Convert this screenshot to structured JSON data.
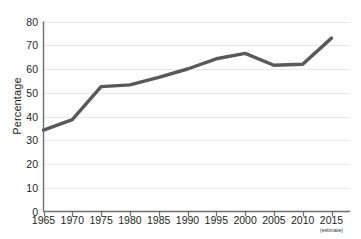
{
  "chart_data": {
    "type": "line",
    "title": "",
    "subtitle": "",
    "xlabel": "",
    "ylabel": "Percentage",
    "x": [
      1965,
      1970,
      1975,
      1980,
      1985,
      1990,
      1995,
      2000,
      2005,
      2010,
      2015
    ],
    "categories": [
      "1965",
      "1970",
      "1975",
      "1980",
      "1985",
      "1990",
      "1995",
      "2000",
      "2005",
      "2010",
      "2015"
    ],
    "values": [
      34.3,
      38.7,
      52.6,
      53.3,
      56.5,
      60.0,
      64.3,
      66.6,
      61.6,
      62.0,
      73.0
    ],
    "series": [
      {
        "name": "Percentage",
        "values": [
          34.3,
          38.7,
          52.6,
          53.3,
          56.5,
          60.0,
          64.3,
          66.6,
          61.6,
          62.0,
          73.0
        ],
        "color": "#595959"
      }
    ],
    "xlim": [
      1965,
      2015
    ],
    "ylim": [
      0,
      80
    ],
    "y_ticks": [
      0,
      10,
      20,
      30,
      40,
      50,
      60,
      70,
      80
    ],
    "y_tick_labels": [
      "0",
      "10",
      "20",
      "30",
      "40",
      "50",
      "60",
      "70",
      "80"
    ],
    "x_ticks": [
      1965,
      1970,
      1975,
      1980,
      1985,
      1990,
      1995,
      2000,
      2005,
      2010,
      2015
    ],
    "x_tick_labels": [
      "1965",
      "1970",
      "1975",
      "1980",
      "1985",
      "1990",
      "1995",
      "2000",
      "2005",
      "2010",
      "2015"
    ],
    "x_tick_sublabels": [
      "",
      "",
      "",
      "",
      "",
      "",
      "",
      "",
      "",
      "",
      "(estimate)"
    ],
    "grid": {
      "horizontal": true,
      "vertical": false,
      "color": "#e8e8e8"
    },
    "legend": {
      "visible": false,
      "position": "none",
      "entries": []
    },
    "axis_color": "#6d6d6d",
    "background_color": "#ffffff",
    "line_width_px": 3.4,
    "markers": false,
    "annotations": []
  }
}
